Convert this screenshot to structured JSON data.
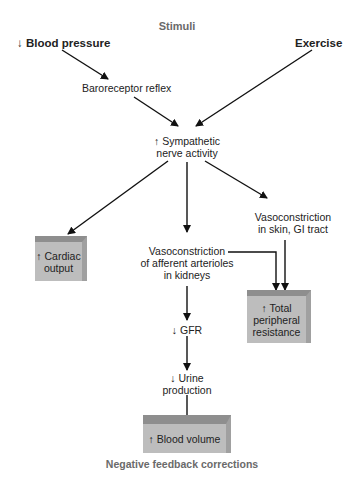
{
  "title": "Stimuli",
  "footer": "Negative feedback corrections",
  "nodes": {
    "blood_pressure": "↓ Blood pressure",
    "exercise": "Exercise",
    "baroreceptor": "Baroreceptor reflex",
    "sympathetic_1": "↑ Sympathetic",
    "sympathetic_2": "nerve activity",
    "vaso_skin_1": "Vasoconstriction",
    "vaso_skin_2": "in skin, GI tract",
    "vaso_kidney_1": "Vasoconstriction",
    "vaso_kidney_2": "of afferent arterioles",
    "vaso_kidney_3": "in kidneys",
    "gfr": "↓ GFR",
    "urine_1": "↓ Urine",
    "urine_2": "production"
  },
  "outcomes": {
    "cardiac_1": "↑ Cardiac",
    "cardiac_2": "output",
    "tpr_1": "↑ Total",
    "tpr_2": "peripheral",
    "tpr_3": "resistance",
    "blood_volume": "↑ Blood volume"
  },
  "colors": {
    "box_fill": "#bdbdbd",
    "box_top": "#8e8e8e",
    "label_grey": "#6a6a6a",
    "arrow": "#111111"
  }
}
